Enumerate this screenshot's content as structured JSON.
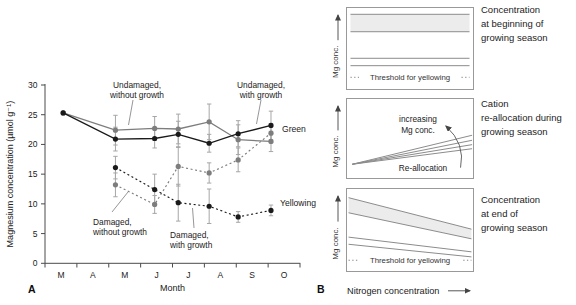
{
  "figure": {
    "panel_a_label": "A",
    "panel_b_label": "B",
    "colors": {
      "black_series": "#1a1a1a",
      "gray_series": "#7d7d7d",
      "error_bar": "#a6a6a6",
      "axis": "#4a4a4a",
      "schematic_line": "#8c8c8c",
      "band_fill": "#ececec",
      "text": "#222222"
    }
  },
  "chart_data": [
    {
      "id": "mg-seasonal-chart",
      "type": "line",
      "title": "",
      "xlabel": "Month",
      "ylabel": "Magnesium concentration (µmol g⁻¹)",
      "x_tick_labels": [
        "M",
        "A",
        "M",
        "J",
        "J",
        "A",
        "S",
        "O"
      ],
      "ylim": [
        0,
        30
      ],
      "yticks": [
        0,
        5,
        10,
        15,
        20,
        25,
        30
      ],
      "x_months": [
        0.57,
        2.21,
        3.44,
        4.18,
        5.15,
        6.06,
        7.09
      ],
      "series": [
        {
          "name": "Undamaged, without growth",
          "color": "gray",
          "style": "solid",
          "values": [
            25.3,
            22.4,
            22.7,
            22.6,
            23.8,
            20.8,
            20.5
          ],
          "errors": [
            0,
            2.5,
            2.0,
            2.5,
            3.0,
            2.5,
            1.7
          ]
        },
        {
          "name": "Undamaged, with growth",
          "color": "black",
          "style": "solid",
          "values": [
            25.3,
            20.9,
            21.0,
            21.7,
            20.2,
            21.8,
            23.2
          ],
          "errors": [
            0,
            2.0,
            1.6,
            2.2,
            1.5,
            2.2,
            2.4
          ]
        },
        {
          "name": "Damaged, without growth",
          "color": "gray",
          "style": "dashed",
          "start_index": 1,
          "values": [
            13.2,
            9.9,
            16.3,
            15.2,
            17.4,
            21.9
          ],
          "errors": [
            2.0,
            1.5,
            3.3,
            1.7,
            2.0,
            1.6
          ]
        },
        {
          "name": "Damaged, with growth",
          "color": "black",
          "style": "dashed",
          "start_index": 1,
          "values": [
            16.1,
            12.4,
            10.2,
            9.6,
            7.8,
            8.9
          ],
          "errors": [
            1.9,
            2.6,
            3.1,
            2.9,
            0.9,
            0.9
          ]
        }
      ],
      "annotations": [
        {
          "lines": [
            "Undamaged,",
            "without growth"
          ],
          "x": 137,
          "y": 88,
          "anchor": "middle",
          "leader": [
            133,
            100,
            128.5,
            125
          ]
        },
        {
          "lines": [
            "Undamaged,",
            "with growth"
          ],
          "x": 261,
          "y": 88,
          "anchor": "middle",
          "leader": [
            261,
            100,
            256.5,
            124
          ]
        },
        {
          "lines": [
            "Damaged,",
            "without growth"
          ],
          "x": 93,
          "y": 225,
          "anchor": "start",
          "leader": [
            112,
            212,
            128,
            192
          ]
        },
        {
          "lines": [
            "Damaged,",
            "with growth"
          ],
          "x": 170,
          "y": 238,
          "anchor": "start",
          "leader": [
            194,
            228,
            192.5,
            208
          ]
        }
      ],
      "end_labels": [
        {
          "text": "Green",
          "x": 282,
          "y": 132
        },
        {
          "text": "Yellowing",
          "x": 280,
          "y": 206
        }
      ]
    },
    {
      "id": "schematic-beginning",
      "type": "schematic",
      "title": "Concentration at beginning of growing season",
      "caption_lines": [
        "Concentration",
        "at beginning of",
        "growing season"
      ],
      "ylabel": "Mg conc.",
      "threshold_label": "Threshold for yellowing",
      "threshold_y": 0.847,
      "inset": 0.035,
      "bands": [
        {
          "fill": true,
          "y_left": [
            0.088,
            0.298
          ],
          "y_right": [
            0.088,
            0.298
          ]
        },
        {
          "fill": false,
          "y_left": [
            0.618,
            0.707
          ],
          "y_right": [
            0.618,
            0.707
          ]
        }
      ]
    },
    {
      "id": "schematic-reallocation",
      "type": "schematic",
      "title": "Cation re-allocation during growing season",
      "caption_lines": [
        "Cation",
        "re-allocation during",
        "growing season"
      ],
      "ylabel": "Mg conc.",
      "fan": {
        "origin": [
          0.049,
          0.818
        ],
        "end_x": 0.985,
        "end_ys": [
          0.46,
          0.522,
          0.576,
          0.626
        ]
      },
      "fan_label": [
        "increasing",
        "Mg conc."
      ],
      "fan_label2": "Re-allocation",
      "arrow": {
        "from": [
          0.895,
          0.86
        ],
        "ctrl": [
          0.935,
          0.565
        ],
        "to": [
          0.78,
          0.345
        ]
      }
    },
    {
      "id": "schematic-end",
      "type": "schematic",
      "title": "Concentration at end of growing season",
      "caption_lines": [
        "Concentration",
        "at end of",
        "growing season"
      ],
      "ylabel": "Mg conc.",
      "xlabel": "Nitrogen concentration",
      "threshold_label": "Threshold for yellowing",
      "threshold_y": 0.86,
      "inset": 0.02,
      "bands": [
        {
          "fill": true,
          "y_left": [
            0.115,
            0.295
          ],
          "y_right": [
            0.49,
            0.605
          ]
        },
        {
          "fill": false,
          "y_left": [
            0.585,
            0.67
          ],
          "y_right": [
            0.76,
            0.82
          ]
        }
      ]
    }
  ]
}
